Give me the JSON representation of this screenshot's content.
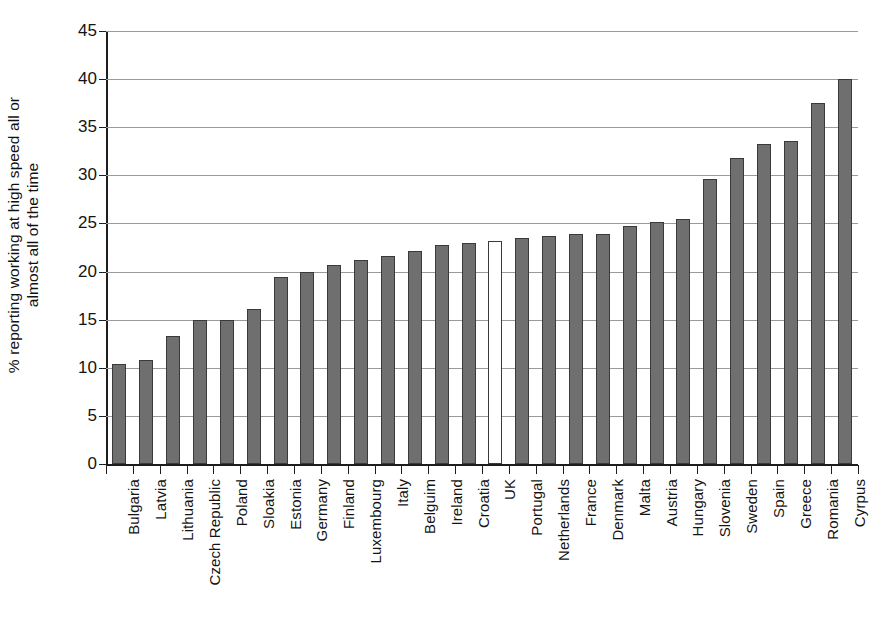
{
  "chart_data": {
    "type": "bar",
    "title": "",
    "xlabel": "",
    "ylabel": "% reporting working at high speed all or almost all of the time",
    "ylabel_line1": "% reporting working at high speed all or",
    "ylabel_line2": "almost all of the time",
    "ylim": [
      0,
      45
    ],
    "ytick_step": 5,
    "yticks": [
      "0",
      "5",
      "10",
      "15",
      "20",
      "25",
      "30",
      "35",
      "40",
      "45"
    ],
    "grid": true,
    "legend": "none",
    "bar_color": "#6f6f6f",
    "highlight_color": "#ffffff",
    "bar_outline_color": "#3a3a3a",
    "highlight_category": "UK",
    "categories": [
      "Bulgaria",
      "Latvia",
      "Lithuania",
      "Czech Republic",
      "Poland",
      "Sloakia",
      "Estonia",
      "Germany",
      "Finland",
      "Luxembourg",
      "Italy",
      "Belguim",
      "Ireland",
      "Croatia",
      "UK",
      "Portugal",
      "Netherlands",
      "France",
      "Denmark",
      "Malta",
      "Austria",
      "Hungary",
      "Slovenia",
      "Sweden",
      "Spain",
      "Greece",
      "Romania",
      "Cyrpus"
    ],
    "values": [
      10.4,
      10.8,
      13.3,
      15.0,
      15.0,
      16.1,
      19.4,
      20.0,
      20.7,
      21.2,
      21.6,
      22.1,
      22.8,
      23.0,
      23.2,
      23.5,
      23.7,
      23.9,
      23.9,
      24.7,
      25.2,
      25.5,
      29.6,
      31.8,
      33.3,
      33.6,
      37.5,
      40.0
    ]
  }
}
